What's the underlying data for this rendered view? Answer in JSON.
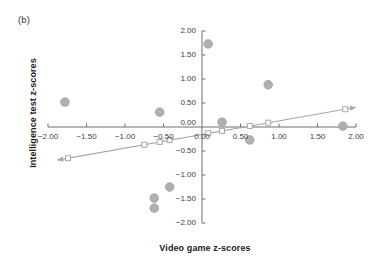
{
  "figure": {
    "panel_label": "(b)",
    "xlabel": "Video game z-scores",
    "ylabel": "Intelligence test z-scores"
  },
  "colors": {
    "marker": "#b0b0b0",
    "marker_stroke": "#9a9a9a",
    "line": "#a8a8a8",
    "axis": "#6f6f6f",
    "text": "#1d1d1d",
    "tick_text": "#3d3d3d"
  },
  "chart_data": {
    "type": "scatter",
    "title": "",
    "xlabel": "Video game z-scores",
    "ylabel": "Intelligence test z-scores",
    "xlim": [
      -2.0,
      2.0
    ],
    "ylim": [
      -2.0,
      2.0
    ],
    "grid": false,
    "legend": "none",
    "xticks": [
      -2.0,
      -1.5,
      -1.0,
      -0.5,
      0.0,
      0.5,
      1.0,
      1.5,
      2.0
    ],
    "xtick_labels": [
      "-2.00",
      "-1.50",
      "-1.00",
      "-0.50",
      "0.00",
      "0.50",
      "1.00",
      "1.50",
      "2.00"
    ],
    "yticks": [
      -2.0,
      -1.5,
      -1.0,
      -0.5,
      0.0,
      0.5,
      1.0,
      1.5,
      2.0
    ],
    "ytick_labels": [
      "-2.00",
      "-1.50",
      "-1.00",
      "-0.50",
      "0.00",
      "0.50",
      "1.00",
      "1.50",
      "2.00"
    ],
    "series": [
      {
        "name": "Observed data points",
        "marker": "filled-circle",
        "points": [
          {
            "x": 0.08,
            "y": 1.73
          },
          {
            "x": 0.86,
            "y": 0.88
          },
          {
            "x": -1.78,
            "y": 0.52
          },
          {
            "x": -0.55,
            "y": 0.31
          },
          {
            "x": 0.26,
            "y": 0.1
          },
          {
            "x": 1.83,
            "y": 0.02
          },
          {
            "x": 0.62,
            "y": -0.27
          },
          {
            "x": -0.42,
            "y": -1.25
          },
          {
            "x": -0.62,
            "y": -1.48
          },
          {
            "x": -0.62,
            "y": -1.69
          }
        ]
      },
      {
        "name": "Regression fit line",
        "marker": "open-square",
        "line_style": "solid-with-arrows",
        "points": [
          {
            "x": -1.74,
            "y": -0.65
          },
          {
            "x": -0.75,
            "y": -0.37
          },
          {
            "x": -0.55,
            "y": -0.31
          },
          {
            "x": -0.42,
            "y": -0.27
          },
          {
            "x": 0.08,
            "y": -0.13
          },
          {
            "x": 0.26,
            "y": -0.08
          },
          {
            "x": 0.62,
            "y": 0.02
          },
          {
            "x": 0.86,
            "y": 0.09
          },
          {
            "x": 1.86,
            "y": 0.37
          }
        ]
      }
    ]
  }
}
